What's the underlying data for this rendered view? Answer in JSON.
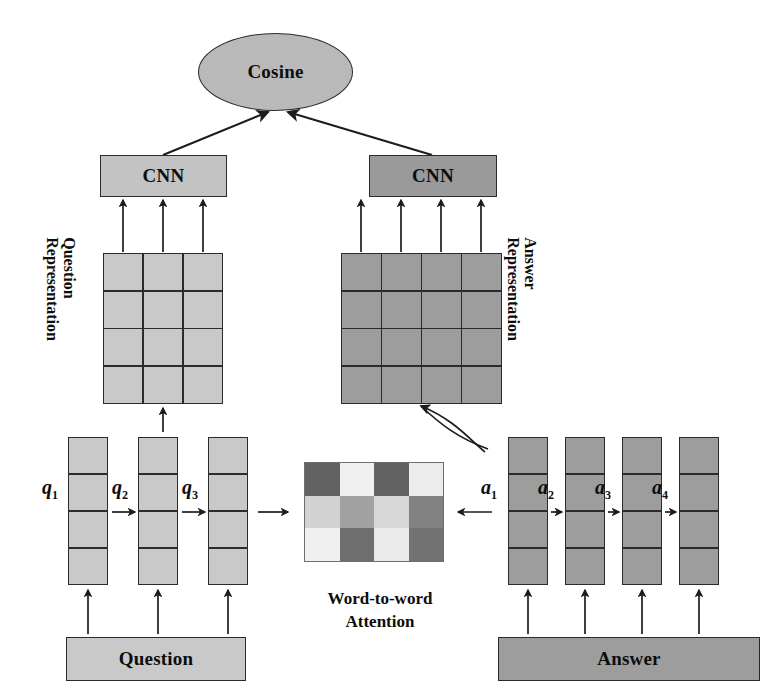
{
  "diagram": {
    "title_nodes": {
      "cosine": "Cosine",
      "cnn_question": "CNN",
      "cnn_answer": "CNN",
      "input_question": "Question",
      "input_answer": "Answer"
    },
    "side_labels": {
      "question_rep_line1": "Question",
      "question_rep_line2": "Representation",
      "answer_rep_line1": "Answer",
      "answer_rep_line2": "Representation"
    },
    "attention": {
      "caption_line1": "Word-to-word",
      "caption_line2": "Attention"
    },
    "question_vectors": [
      {
        "name": "q",
        "sub": "1"
      },
      {
        "name": "q",
        "sub": "2"
      },
      {
        "name": "q",
        "sub": "3"
      }
    ],
    "answer_vectors": [
      {
        "name": "a",
        "sub": "1"
      },
      {
        "name": "a",
        "sub": "2"
      },
      {
        "name": "a",
        "sub": "3"
      },
      {
        "name": "a",
        "sub": "4"
      }
    ]
  },
  "chart_data": {
    "type": "heatmap",
    "title": "Word-to-word Attention",
    "xlabel": "",
    "ylabel": "",
    "rows": 3,
    "cols": 4,
    "row_labels": [
      "q1",
      "q2",
      "q3"
    ],
    "col_labels": [
      "a1",
      "a2",
      "a3",
      "a4"
    ],
    "values": [
      [
        0.22,
        0.95,
        0.22,
        0.93
      ],
      [
        0.8,
        0.55,
        0.82,
        0.38
      ],
      [
        0.95,
        0.28,
        0.92,
        0.3
      ]
    ],
    "colorscale": "grayscale",
    "grid": false,
    "legend": "none"
  },
  "colors": {
    "light_gray": "#c9c9c9",
    "mid_gray": "#9d9d9d",
    "cosine_gray": "#b9b9b9",
    "cnn_question_gray": "#c3c3c3",
    "cnn_answer_gray": "#9a9a9a",
    "stroke": "#2b2b2b",
    "background": "#ffffff"
  },
  "matrices": {
    "question_representation": {
      "cols": 3,
      "rows": 4,
      "fill": "#c9c9c9"
    },
    "answer_representation": {
      "cols": 4,
      "rows": 4,
      "fill": "#9d9d9d"
    }
  }
}
